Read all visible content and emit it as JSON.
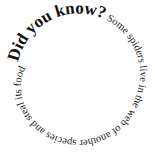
{
  "spiral": {
    "headline": "Did you know?",
    "body": " Some spiders live in the web of another species and steal its food",
    "full_text": "Did you know? Some spiders live in the web of another species and steal its food",
    "colors": {
      "background": "#ffffff",
      "text": "#111111"
    }
  }
}
